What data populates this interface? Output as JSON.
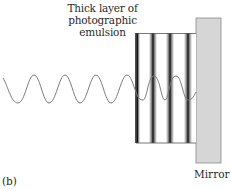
{
  "diagram": {
    "title_line1": "Thick layer of photographic",
    "title_line2": "emulsion",
    "mirror_label": "Mirror",
    "panel_label": "(b)",
    "colors": {
      "wave": "#7a7a7a",
      "stripe": "#1a1a1a",
      "mirror_fill": "#d6d6d6",
      "mirror_border": "#8a8a8a",
      "block_border": "#555555"
    },
    "incident_wave": {
      "x_start": 3,
      "x_end": 136,
      "crest_y": 75,
      "trough_y": 103,
      "cycles": 4.5
    },
    "standing_wave": {
      "x_start": 136,
      "x_end": 196,
      "crest_y": 76,
      "trough_y": 100
    },
    "emulsion_block": {
      "x": 136,
      "y": 33,
      "width": 60,
      "height": 110,
      "stripe_x": [
        137,
        153,
        170,
        188
      ]
    },
    "mirror": {
      "x": 196,
      "y": 18,
      "width": 25,
      "height": 145
    }
  }
}
